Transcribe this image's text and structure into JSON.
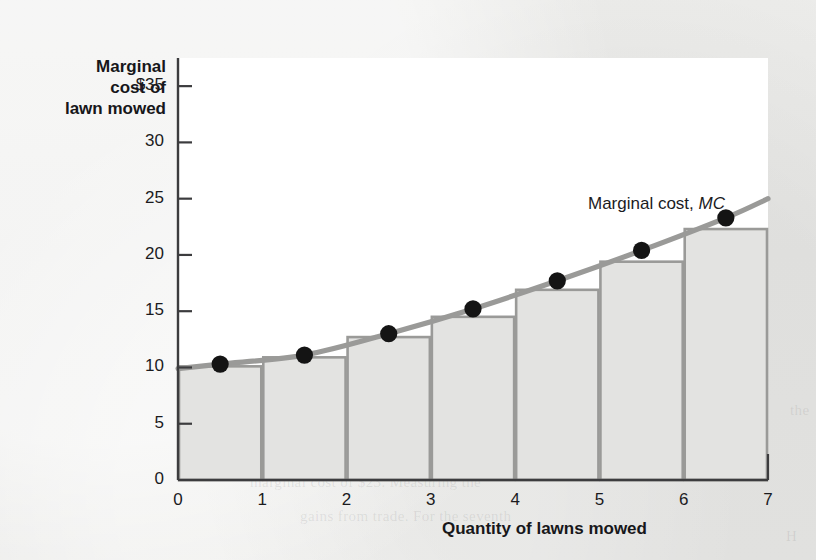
{
  "figure": {
    "y_axis_title": "Marginal\ncost of\nlawn mowed",
    "x_axis_title": "Quantity of lawns mowed",
    "curve_label_text": "Marginal cost, ",
    "curve_label_symbol": "MC"
  },
  "colors": {
    "page_background": "#e9e9e7",
    "plot_background": "#ffffff",
    "axis_line": "#3c3c3e",
    "bar_fill": "#e3e3e1",
    "bar_outline": "#9a9a98",
    "curve": "#9a9a98",
    "point": "#141414",
    "text": "#1b1b1e"
  },
  "bleed_through": [
    {
      "text": "the accompanying table",
      "x": 560,
      "y": 150
    },
    {
      "text": "mowed per week and",
      "x": 600,
      "y": 186
    },
    {
      "text": "to mow the lawns",
      "x": 560,
      "y": 222
    },
    {
      "text": "ceases to be",
      "x": 614,
      "y": 258
    },
    {
      "text": "are in the market for",
      "x": 470,
      "y": 294
    },
    {
      "text": "the lawn mowed",
      "x": 440,
      "y": 330
    },
    {
      "text": "per week, and",
      "x": 520,
      "y": 366
    },
    {
      "text": "mowing is $10, and",
      "x": 360,
      "y": 402
    },
    {
      "text": "willingness to pay of $25 and the",
      "x": 300,
      "y": 438
    },
    {
      "text": "marginal cost of $23. Measuring the",
      "x": 250,
      "y": 474
    },
    {
      "text": "gains from trade. For the seventh",
      "x": 300,
      "y": 508
    },
    {
      "text": "the",
      "x": 790,
      "y": 402
    },
    {
      "text": "H",
      "x": 786,
      "y": 528
    }
  ],
  "chart_data": {
    "type": "bar",
    "title": "",
    "xlabel": "Quantity of lawns mowed",
    "ylabel": "Marginal cost of lawn mowed",
    "xlim": [
      0,
      7
    ],
    "ylim": [
      0,
      37
    ],
    "grid": false,
    "legend": "inline-annotation",
    "x_ticks": [
      0,
      1,
      2,
      3,
      4,
      5,
      6,
      7
    ],
    "x_tick_labels": [
      "0",
      "1",
      "2",
      "3",
      "4",
      "5",
      "6",
      "7"
    ],
    "y_ticks": [
      0,
      5,
      10,
      15,
      20,
      25,
      30,
      35
    ],
    "y_tick_labels": [
      "0",
      "5",
      "10",
      "15",
      "20",
      "25",
      "30",
      "$35"
    ],
    "categories": [
      "1",
      "2",
      "3",
      "4",
      "5",
      "6",
      "7"
    ],
    "values": [
      10.1,
      10.9,
      12.7,
      14.5,
      16.9,
      19.4,
      22.3
    ],
    "series": [
      {
        "name": "Marginal cost bars",
        "type": "bar",
        "values": [
          10.1,
          10.9,
          12.7,
          14.5,
          16.9,
          19.4,
          22.3
        ]
      },
      {
        "name": "Marginal cost, MC",
        "type": "line",
        "points": [
          {
            "x": 0.0,
            "y": 9.9
          },
          {
            "x": 0.5,
            "y": 10.3
          },
          {
            "x": 1.5,
            "y": 11.1
          },
          {
            "x": 2.5,
            "y": 13.0
          },
          {
            "x": 3.5,
            "y": 15.2
          },
          {
            "x": 4.5,
            "y": 17.7
          },
          {
            "x": 5.5,
            "y": 20.4
          },
          {
            "x": 6.5,
            "y": 23.3
          },
          {
            "x": 7.0,
            "y": 25.0
          }
        ]
      }
    ],
    "markers": [
      {
        "x": 0.5,
        "y": 10.3
      },
      {
        "x": 1.5,
        "y": 11.1
      },
      {
        "x": 2.5,
        "y": 13.0
      },
      {
        "x": 3.5,
        "y": 15.2
      },
      {
        "x": 4.5,
        "y": 17.7
      },
      {
        "x": 5.5,
        "y": 20.4
      },
      {
        "x": 6.5,
        "y": 23.3
      }
    ],
    "annotations": [
      {
        "text": "Marginal cost, MC",
        "x": 5.0,
        "y": 27.5
      }
    ]
  }
}
